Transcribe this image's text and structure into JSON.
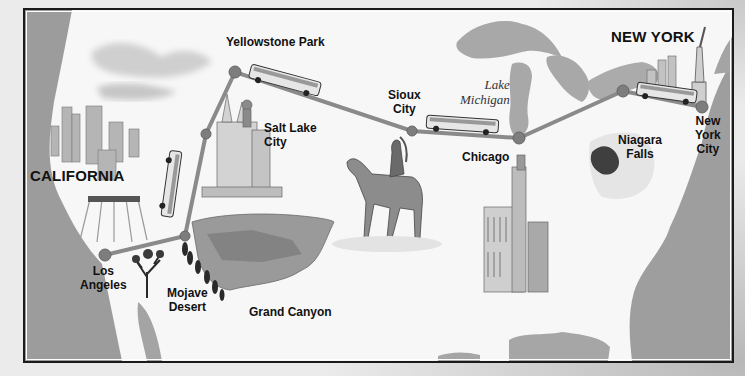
{
  "map": {
    "type": "illustrated-route-map",
    "colors": {
      "route": "#8a8a8a",
      "node": "#7a7a7a",
      "ocean": "#9a9a9a",
      "lakes": "#a8a8a8",
      "paper": "#f7f7f7",
      "frame": "#1a1a1a"
    },
    "regions": [
      {
        "id": "california",
        "label": "CALIFORNIA"
      },
      {
        "id": "new-york",
        "label": "NEW YORK"
      }
    ],
    "water": [
      {
        "id": "lake-michigan",
        "lines": [
          "Lake",
          "Michigan"
        ]
      }
    ],
    "stops": [
      {
        "id": "los-angeles",
        "lines": [
          "Los",
          "Angeles"
        ]
      },
      {
        "id": "mojave-desert",
        "lines": [
          "Mojave",
          "Desert"
        ]
      },
      {
        "id": "grand-canyon",
        "lines": [
          "Grand Canyon"
        ]
      },
      {
        "id": "salt-lake-city",
        "lines": [
          "Salt Lake",
          "City"
        ]
      },
      {
        "id": "yellowstone-park",
        "lines": [
          "Yellowstone Park"
        ]
      },
      {
        "id": "sioux-city",
        "lines": [
          "Sioux",
          "City"
        ]
      },
      {
        "id": "chicago",
        "lines": [
          "Chicago"
        ]
      },
      {
        "id": "niagara-falls",
        "lines": [
          "Niagara",
          "Falls"
        ]
      },
      {
        "id": "new-york-city",
        "lines": [
          "New",
          "York",
          "City"
        ]
      }
    ],
    "route_order": [
      "Los Angeles",
      "Mojave Desert",
      "Salt Lake City",
      "Yellowstone Park",
      "Sioux City",
      "Chicago",
      "Niagara Falls",
      "New York City"
    ],
    "illustrations": [
      "skyline-los-angeles",
      "temple-salt-lake",
      "joshua-tree",
      "grand-canyon-cliffs",
      "horse-rider",
      "chicago-towers",
      "niagara-falls-waterfall",
      "new-york-skyline",
      "statue-of-liberty",
      "bus",
      "bus",
      "bus",
      "bus"
    ]
  }
}
